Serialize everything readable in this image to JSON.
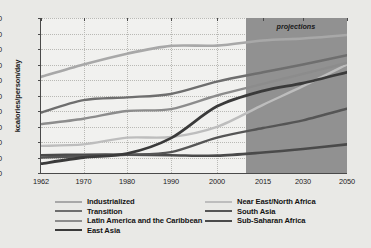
{
  "chart_data": {
    "type": "line",
    "title": "",
    "xlabel": "",
    "ylabel": "kcalories/person/day",
    "ylim": [
      0,
      1000
    ],
    "ytick_labels": [
      "0",
      "100",
      "200",
      "300",
      "400",
      "500",
      "600",
      "700",
      "800",
      "900",
      "1000"
    ],
    "ytick_values": [
      0,
      100,
      200,
      300,
      400,
      500,
      600,
      700,
      800,
      900,
      1000
    ],
    "x": [
      1962,
      1970,
      1980,
      1990,
      2000,
      2015,
      2030,
      2050
    ],
    "xtick_labels": [
      "1962",
      "1970",
      "1980",
      "1990",
      "2000",
      "2015",
      "2030",
      "2050"
    ],
    "grid": true,
    "legend_position": "bottom",
    "annotations": [
      {
        "text": "projections",
        "style": "italic",
        "region_start": 2005,
        "region_end": 2050
      }
    ],
    "series": [
      {
        "name": "Industrialized",
        "color": "#a8a8a8",
        "width": 2.6,
        "values": [
          620,
          700,
          770,
          820,
          822,
          855,
          868,
          890
        ]
      },
      {
        "name": "Transition",
        "color": "#6e6e6e",
        "width": 2.4,
        "values": [
          390,
          470,
          488,
          510,
          590,
          650,
          700,
          760
        ]
      },
      {
        "name": "Latin America and the Caribbean",
        "color": "#8c8c8c",
        "width": 2.4,
        "values": [
          315,
          350,
          400,
          412,
          500,
          575,
          640,
          710
        ]
      },
      {
        "name": "East Asia",
        "color": "#3a3a3a",
        "width": 2.8,
        "values": [
          60,
          100,
          125,
          225,
          430,
          530,
          580,
          650
        ]
      },
      {
        "name": "Near East/North Africa",
        "color": "#bdbdbd",
        "width": 2.4,
        "values": [
          175,
          185,
          228,
          232,
          298,
          440,
          560,
          700
        ]
      },
      {
        "name": "South Asia",
        "color": "#555555",
        "width": 2.4,
        "values": [
          100,
          108,
          118,
          135,
          228,
          290,
          340,
          415
        ]
      },
      {
        "name": "Sub-Saharan Africa",
        "color": "#4a4a4a",
        "width": 2.6,
        "values": [
          115,
          118,
          118,
          115,
          112,
          132,
          155,
          185
        ]
      }
    ]
  },
  "legend": {
    "columns": [
      {
        "items": [
          "Industrialized",
          "Transition",
          "Latin America and the Caribbean",
          "East Asia"
        ]
      },
      {
        "items": [
          "Near East/North Africa",
          "South Asia",
          "Sub-Saharan Africa"
        ]
      }
    ]
  },
  "colors": {
    "page_background": "#e9e9e6",
    "plot_background": "#f1f1ef",
    "projection_band": "#919191",
    "axis": "#4a4a4a",
    "gridline": "#b9b9b5",
    "text": "#141414"
  }
}
